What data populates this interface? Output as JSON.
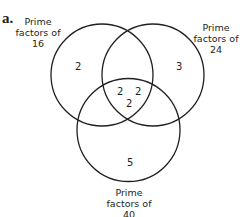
{
  "part_label": "a.",
  "sets": {
    "a": {
      "label_line1": "Prime",
      "label_line2": "factors of",
      "label_line3": "16"
    },
    "b": {
      "label_line1": "Prime",
      "label_line2": "factors of",
      "label_line3": "24"
    },
    "c": {
      "label_line1": "Prime",
      "label_line2": "factors of",
      "label_line3": "40"
    }
  },
  "regions": {
    "only_16": "2",
    "only_24": "3",
    "only_40": "5",
    "16_and_24_left": "2",
    "16_and_24_right": "2",
    "all_three": "2"
  },
  "colors": {
    "stroke": "#231f20",
    "text": "#231f20"
  }
}
